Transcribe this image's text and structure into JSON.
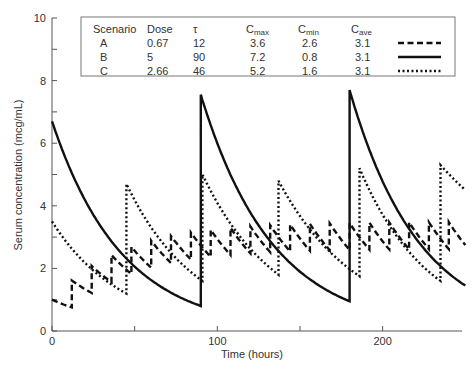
{
  "chart_data": {
    "type": "line",
    "title": "",
    "xlabel": "Time (hours)",
    "ylabel": "Serum concentration (mcg/mL)",
    "xlim": [
      0,
      250
    ],
    "ylim": [
      0,
      10
    ],
    "xticks": [
      0,
      50,
      100,
      150,
      200
    ],
    "xtick_labels": [
      "0",
      "",
      "100",
      "",
      "200"
    ],
    "yticks": [
      0,
      1,
      2,
      3,
      4,
      5,
      6,
      7,
      8,
      9,
      10
    ],
    "ytick_labels": [
      "0",
      "",
      "2",
      "",
      "4",
      "",
      "6",
      "",
      "8",
      "",
      "10"
    ],
    "grid": false,
    "legend_position": "top-inside-table",
    "table": {
      "headers": [
        "Scenario",
        "Dose",
        "τ",
        "C_max",
        "C_min",
        "C_ave"
      ],
      "header_display": [
        {
          "main": "Scenario",
          "sub": ""
        },
        {
          "main": "Dose",
          "sub": ""
        },
        {
          "main": "τ",
          "sub": ""
        },
        {
          "main": "C",
          "sub": "max"
        },
        {
          "main": "C",
          "sub": "min"
        },
        {
          "main": "C",
          "sub": "ave"
        }
      ],
      "rows": [
        {
          "scenario": "A",
          "dose": "0.67",
          "tau": "12",
          "cmax": "3.6",
          "cmin": "2.6",
          "cave": "3.1",
          "line_style": "dashed"
        },
        {
          "scenario": "B",
          "dose": "5",
          "tau": "90",
          "cmax": "7.2",
          "cmin": "0.8",
          "cave": "3.1",
          "line_style": "solid"
        },
        {
          "scenario": "C",
          "dose": "2.66",
          "tau": "46",
          "cmax": "5.2",
          "cmin": "1.6",
          "cave": "3.1",
          "line_style": "dotted"
        }
      ]
    },
    "series": [
      {
        "name": "A",
        "style": "dashed",
        "tau": 12,
        "k": 0.0236,
        "start": 1.0,
        "dose_increment": 0.67,
        "approx_points": [
          [
            0,
            1.0
          ],
          [
            10,
            0.8
          ],
          [
            12,
            1.6
          ],
          [
            24,
            1.3
          ],
          [
            24,
            2.0
          ],
          [
            36,
            1.7
          ],
          [
            36,
            2.4
          ],
          [
            48,
            2.0
          ],
          [
            48,
            2.7
          ],
          [
            96,
            3.3
          ],
          [
            250,
            3.0
          ]
        ]
      },
      {
        "name": "B",
        "style": "solid",
        "tau": 90,
        "k": 0.0236,
        "approx_points": [
          [
            0,
            6.7
          ],
          [
            90,
            0.8
          ],
          [
            90,
            7.55
          ],
          [
            180,
            0.95
          ],
          [
            180,
            7.7
          ],
          [
            250,
            1.45
          ]
        ]
      },
      {
        "name": "C",
        "style": "dotted",
        "tau": 46,
        "k": 0.0236,
        "approx_points": [
          [
            0,
            3.5
          ],
          [
            45,
            1.2
          ],
          [
            45,
            4.7
          ],
          [
            91,
            1.6
          ],
          [
            91,
            5.0
          ],
          [
            137,
            1.8
          ],
          [
            137,
            4.8
          ],
          [
            186,
            1.75
          ],
          [
            186,
            5.2
          ],
          [
            235,
            1.6
          ],
          [
            235,
            5.3
          ],
          [
            250,
            4.5
          ]
        ]
      }
    ]
  },
  "colors": {
    "line": "#111111",
    "axis": "#555555",
    "text": "#333333",
    "box": "#777777"
  }
}
